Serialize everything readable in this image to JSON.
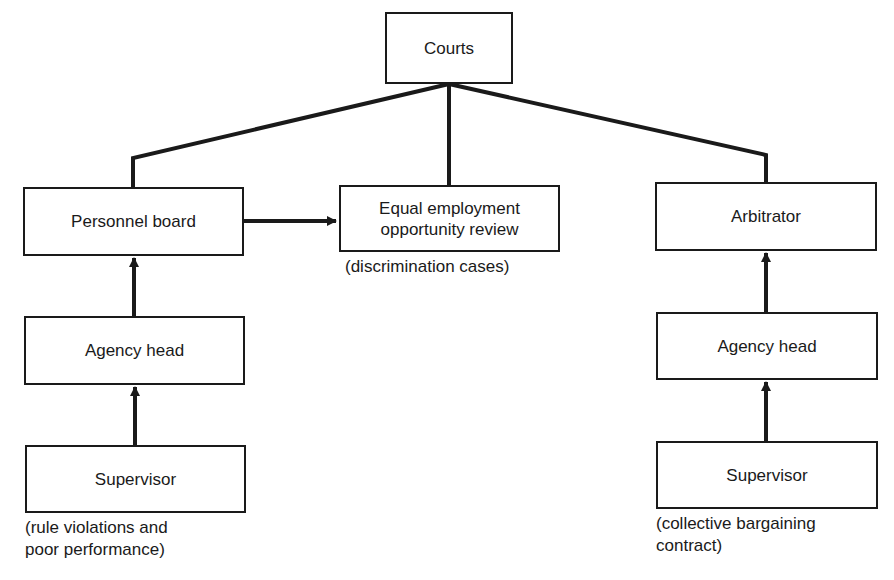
{
  "diagram": {
    "nodes": {
      "courts": "Courts",
      "personnel_board": "Personnel board",
      "eeo_review": "Equal employment opportunity review",
      "arbitrator": "Arbitrator",
      "agency_head_left": "Agency head",
      "agency_head_right": "Agency head",
      "supervisor_left": "Supervisor",
      "supervisor_right": "Supervisor"
    },
    "captions": {
      "eeo": "(discrimination cases)",
      "left_supervisor": "(rule violations and\npoor performance)",
      "right_supervisor": "(collective bargaining\ncontract)"
    },
    "edges": [
      {
        "from": "supervisor_left",
        "to": "agency_head_left",
        "type": "arrow"
      },
      {
        "from": "agency_head_left",
        "to": "personnel_board",
        "type": "arrow"
      },
      {
        "from": "personnel_board",
        "to": "eeo_review",
        "type": "arrow"
      },
      {
        "from": "supervisor_right",
        "to": "agency_head_right",
        "type": "arrow"
      },
      {
        "from": "agency_head_right",
        "to": "arbitrator",
        "type": "arrow"
      },
      {
        "from": "personnel_board",
        "to": "courts",
        "type": "line"
      },
      {
        "from": "eeo_review",
        "to": "courts",
        "type": "line"
      },
      {
        "from": "arbitrator",
        "to": "courts",
        "type": "line"
      }
    ]
  }
}
